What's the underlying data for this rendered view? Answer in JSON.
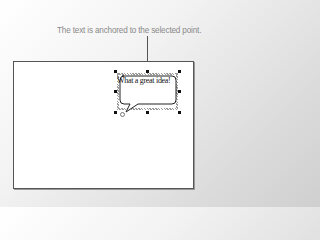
{
  "caption": "The text is anchored to the selected point.",
  "callout": {
    "text": "What a great idea!",
    "shape": "speech-bubble",
    "state": "selected"
  },
  "colors": {
    "caption": "#8a8a8a",
    "page_border": "#555555",
    "handle": "#111111"
  }
}
